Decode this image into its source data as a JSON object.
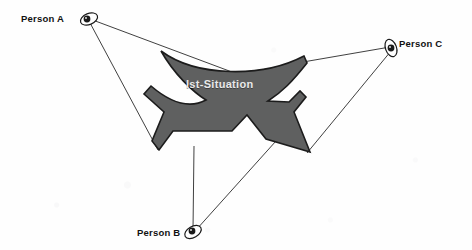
{
  "diagram": {
    "title": "Ist-Situation",
    "background_color": "#fefefe",
    "shape": {
      "label": "Ist-Situation",
      "name": "ist-situation-shape",
      "fill_color": "#5f6060",
      "stroke_color": "#1c1c1c",
      "label_color": "#e9e9e9"
    },
    "observers": [
      {
        "id": "person-a",
        "label": "Person A",
        "icon": "eye-icon",
        "label_side": "left",
        "eye": {
          "x": 89,
          "y": 18
        }
      },
      {
        "id": "person-b",
        "label": "Person B",
        "icon": "eye-icon",
        "label_side": "left",
        "eye": {
          "x": 193,
          "y": 232
        }
      },
      {
        "id": "person-c",
        "label": "Person C",
        "icon": "eye-icon",
        "label_side": "right",
        "eye": {
          "x": 392,
          "y": 48
        }
      }
    ],
    "sight_lines": [
      {
        "from": "person-a",
        "to_x": 240,
        "to_y": 75,
        "name": "sightline-person-a-upper"
      },
      {
        "from": "person-a",
        "to_x": 158,
        "to_y": 148,
        "name": "sightline-person-a-lower"
      },
      {
        "from": "person-c",
        "to_x": 305,
        "to_y": 64,
        "name": "sightline-person-c-upper"
      },
      {
        "from": "person-c",
        "to_x": 308,
        "to_y": 152,
        "name": "sightline-person-c-lower"
      },
      {
        "from": "person-b",
        "to_x": 194,
        "to_y": 148,
        "name": "sightline-person-b-left"
      },
      {
        "from": "person-b",
        "to_x": 274,
        "to_y": 143,
        "name": "sightline-person-b-right"
      }
    ],
    "line_color": "#2a2a2a"
  }
}
